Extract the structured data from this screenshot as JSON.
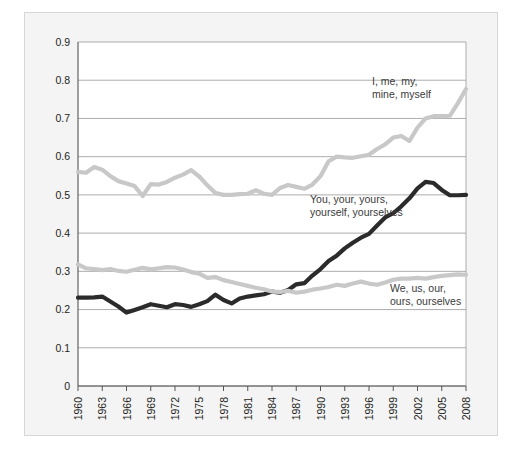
{
  "figure": {
    "background_color": "#ffffff",
    "panel_color": "#f4f4f4",
    "panel_border_color": "#d7d7d7",
    "plot_background_color": "#ffffff"
  },
  "chart_data": {
    "type": "line",
    "title": "",
    "subtitle": "",
    "xlabel": "",
    "ylabel": "",
    "xlim": [
      1960,
      2008
    ],
    "ylim": [
      0,
      0.9
    ],
    "grid": true,
    "grid_axis": "y",
    "legend_position": "inline-annotations",
    "ytick_labels": [
      "0",
      "0.1",
      "0.2",
      "0.3",
      "0.4",
      "0.5",
      "0.6",
      "0.7",
      "0.8",
      "0.9"
    ],
    "ytick_values": [
      0,
      0.1,
      0.2,
      0.3,
      0.4,
      0.5,
      0.6,
      0.7,
      0.8,
      0.9
    ],
    "xtick_labels": [
      "1960",
      "1963",
      "1966",
      "1969",
      "1972",
      "1975",
      "1978",
      "1981",
      "1984",
      "1987",
      "1990",
      "1993",
      "1996",
      "1999",
      "2002",
      "2005",
      "2008"
    ],
    "xtick_values": [
      1960,
      1963,
      1966,
      1969,
      1972,
      1975,
      1978,
      1981,
      1984,
      1987,
      1990,
      1993,
      1996,
      1999,
      2002,
      2005,
      2008
    ],
    "x": [
      1960,
      1961,
      1962,
      1963,
      1964,
      1965,
      1966,
      1967,
      1968,
      1969,
      1970,
      1971,
      1972,
      1973,
      1974,
      1975,
      1976,
      1977,
      1978,
      1979,
      1980,
      1981,
      1982,
      1983,
      1984,
      1985,
      1986,
      1987,
      1988,
      1989,
      1990,
      1991,
      1992,
      1993,
      1994,
      1995,
      1996,
      1997,
      1998,
      1999,
      2000,
      2001,
      2002,
      2003,
      2004,
      2005,
      2006,
      2007,
      2008
    ],
    "series": [
      {
        "name": "I, me, my, mine, myself",
        "color": "#c8c8c8",
        "annotation": "I, me, my,\nmine, myself",
        "annotation_line1": "I, me, my,",
        "annotation_line2": "mine, myself",
        "values": [
          0.56,
          0.558,
          0.573,
          0.566,
          0.549,
          0.536,
          0.53,
          0.523,
          0.497,
          0.528,
          0.527,
          0.534,
          0.545,
          0.553,
          0.565,
          0.548,
          0.525,
          0.505,
          0.5,
          0.5,
          0.502,
          0.503,
          0.512,
          0.503,
          0.5,
          0.518,
          0.526,
          0.521,
          0.516,
          0.527,
          0.549,
          0.588,
          0.6,
          0.598,
          0.597,
          0.601,
          0.605,
          0.62,
          0.632,
          0.65,
          0.654,
          0.641,
          0.676,
          0.7,
          0.706,
          0.706,
          0.707,
          0.74,
          0.777
        ]
      },
      {
        "name": "You, your, yours, yourself, yourselves",
        "color": "#2b2b2b",
        "annotation": "You, your, yours,\nyourself, yourselves",
        "annotation_line1": "You, your, yours,",
        "annotation_line2": "yourself, yourselves",
        "values": [
          0.231,
          0.231,
          0.232,
          0.234,
          0.221,
          0.208,
          0.192,
          0.199,
          0.206,
          0.214,
          0.21,
          0.206,
          0.214,
          0.212,
          0.207,
          0.214,
          0.222,
          0.239,
          0.225,
          0.216,
          0.229,
          0.234,
          0.237,
          0.24,
          0.247,
          0.244,
          0.251,
          0.266,
          0.269,
          0.289,
          0.306,
          0.327,
          0.341,
          0.36,
          0.375,
          0.388,
          0.398,
          0.42,
          0.441,
          0.452,
          0.47,
          0.491,
          0.517,
          0.534,
          0.531,
          0.513,
          0.499,
          0.499,
          0.5
        ]
      },
      {
        "name": "We, us, our, ours, ourselves",
        "color": "#c8c8c8",
        "annotation": "We, us, our,\nours, ourselves",
        "annotation_line1": "We, us, our,",
        "annotation_line2": "ours, ourselves",
        "values": [
          0.318,
          0.308,
          0.306,
          0.303,
          0.306,
          0.301,
          0.299,
          0.304,
          0.309,
          0.305,
          0.308,
          0.311,
          0.31,
          0.305,
          0.298,
          0.294,
          0.283,
          0.285,
          0.277,
          0.272,
          0.267,
          0.262,
          0.257,
          0.253,
          0.247,
          0.246,
          0.249,
          0.244,
          0.247,
          0.252,
          0.255,
          0.259,
          0.265,
          0.262,
          0.268,
          0.273,
          0.268,
          0.265,
          0.271,
          0.278,
          0.281,
          0.281,
          0.283,
          0.281,
          0.285,
          0.288,
          0.29,
          0.292,
          0.291
        ]
      }
    ]
  }
}
